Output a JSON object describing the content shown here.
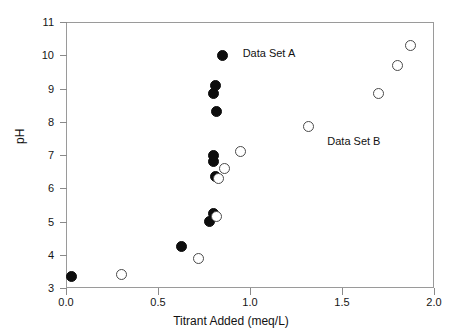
{
  "chart_data": {
    "type": "scatter",
    "title": "",
    "xlabel": "Titrant Added (meq/L)",
    "ylabel": "pH",
    "xlim": [
      0.0,
      2.0
    ],
    "ylim": [
      3,
      11
    ],
    "grid": false,
    "legend_position": "in-plot annotations",
    "xticks": [
      "0.0",
      "0.5",
      "1.0",
      "1.5",
      "2.0"
    ],
    "xtick_values": [
      0.0,
      0.5,
      1.0,
      1.5,
      2.0
    ],
    "yticks": [
      "3",
      "4",
      "5",
      "6",
      "7",
      "8",
      "9",
      "10",
      "11"
    ],
    "ytick_values": [
      3,
      4,
      5,
      6,
      7,
      8,
      9,
      10,
      11
    ],
    "annotations": [
      {
        "text": "Data Set A",
        "x": 0.96,
        "y": 10.08
      },
      {
        "text": "Data Set B",
        "x": 1.42,
        "y": 7.42
      }
    ],
    "series": [
      {
        "name": "Data Set A",
        "marker": "filled-circle",
        "color": "#0d0d0d",
        "points": [
          {
            "x": 0.03,
            "y": 3.35
          },
          {
            "x": 0.63,
            "y": 4.25
          },
          {
            "x": 0.78,
            "y": 5.0
          },
          {
            "x": 0.8,
            "y": 5.25
          },
          {
            "x": 0.81,
            "y": 6.35
          },
          {
            "x": 0.8,
            "y": 6.8
          },
          {
            "x": 0.8,
            "y": 7.0
          },
          {
            "x": 0.82,
            "y": 8.3
          },
          {
            "x": 0.8,
            "y": 8.85
          },
          {
            "x": 0.81,
            "y": 9.1
          },
          {
            "x": 0.85,
            "y": 10.0
          }
        ]
      },
      {
        "name": "Data Set B",
        "marker": "open-circle",
        "color": "#4a4a4a",
        "points": [
          {
            "x": 0.3,
            "y": 3.4
          },
          {
            "x": 0.72,
            "y": 3.9
          },
          {
            "x": 0.82,
            "y": 5.15
          },
          {
            "x": 0.83,
            "y": 6.3
          },
          {
            "x": 0.86,
            "y": 6.6
          },
          {
            "x": 0.95,
            "y": 7.1
          },
          {
            "x": 1.32,
            "y": 7.85
          },
          {
            "x": 1.7,
            "y": 8.85
          },
          {
            "x": 1.8,
            "y": 9.7
          },
          {
            "x": 1.87,
            "y": 10.3
          }
        ]
      }
    ]
  }
}
